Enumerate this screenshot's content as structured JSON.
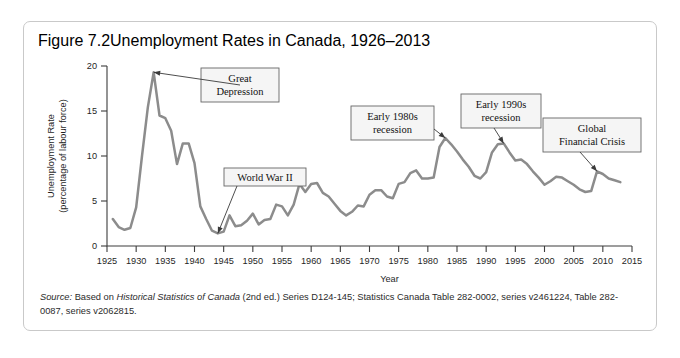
{
  "figure": {
    "number": "Figure 7.2",
    "title": "Unemployment Rates in Canada, 1926–2013"
  },
  "source": {
    "label": "Source:",
    "text_before": " Based on ",
    "italic_work": "Historical Statistics of Canada",
    "text_after": " (2nd ed.) Series D124-145; Statistics Canada Table 282-0002, series v2461224, Table 282-0087, series v2062815."
  },
  "chart_data": {
    "type": "line",
    "title": "Unemployment Rates in Canada, 1926–2013",
    "xlabel": "Year",
    "ylabel": "Unemployment Rate (percentage of labour force)",
    "ylabel_line1": "Unemployment Rate",
    "ylabel_line2": "(percentage of labour force)",
    "xlim": [
      1925,
      2015
    ],
    "ylim": [
      0,
      20
    ],
    "xticks": [
      1925,
      1930,
      1935,
      1940,
      1945,
      1950,
      1955,
      1960,
      1965,
      1970,
      1975,
      1980,
      1985,
      1990,
      1995,
      2000,
      2005,
      2010,
      2015
    ],
    "yticks": [
      0,
      5,
      10,
      15,
      20
    ],
    "grid": false,
    "legend": false,
    "line_color": "#8c8c8c",
    "series": [
      {
        "name": "Unemployment rate",
        "x": [
          1926,
          1927,
          1928,
          1929,
          1930,
          1931,
          1932,
          1933,
          1934,
          1935,
          1936,
          1937,
          1938,
          1939,
          1940,
          1941,
          1942,
          1943,
          1944,
          1945,
          1946,
          1947,
          1948,
          1949,
          1950,
          1951,
          1952,
          1953,
          1954,
          1955,
          1956,
          1957,
          1958,
          1959,
          1960,
          1961,
          1962,
          1963,
          1964,
          1965,
          1966,
          1967,
          1968,
          1969,
          1970,
          1971,
          1972,
          1973,
          1974,
          1975,
          1976,
          1977,
          1978,
          1979,
          1980,
          1981,
          1982,
          1983,
          1984,
          1985,
          1986,
          1987,
          1988,
          1989,
          1990,
          1991,
          1992,
          1993,
          1994,
          1995,
          1996,
          1997,
          1998,
          1999,
          2000,
          2001,
          2002,
          2003,
          2004,
          2005,
          2006,
          2007,
          2008,
          2009,
          2010,
          2011,
          2012,
          2013
        ],
        "values": [
          3.0,
          2.1,
          1.8,
          2.0,
          4.3,
          10.0,
          15.4,
          19.3,
          14.5,
          14.2,
          12.8,
          9.1,
          11.4,
          11.4,
          9.2,
          4.4,
          3.0,
          1.7,
          1.4,
          1.6,
          3.4,
          2.2,
          2.3,
          2.8,
          3.6,
          2.4,
          2.9,
          3.0,
          4.6,
          4.4,
          3.4,
          4.6,
          6.9,
          6.0,
          6.9,
          7.0,
          5.9,
          5.5,
          4.7,
          3.9,
          3.4,
          3.8,
          4.5,
          4.4,
          5.7,
          6.2,
          6.2,
          5.5,
          5.3,
          6.9,
          7.1,
          8.1,
          8.4,
          7.5,
          7.5,
          7.6,
          11.0,
          12.0,
          11.3,
          10.5,
          9.6,
          8.8,
          7.8,
          7.5,
          8.2,
          10.4,
          11.3,
          11.4,
          10.4,
          9.5,
          9.6,
          9.1,
          8.3,
          7.6,
          6.8,
          7.2,
          7.7,
          7.6,
          7.2,
          6.8,
          6.3,
          6.0,
          6.1,
          8.3,
          8.0,
          7.5,
          7.3,
          7.1
        ]
      }
    ],
    "annotations": [
      {
        "id": "great-depression",
        "label_line1": "Great",
        "label_line2": "Depression",
        "points_to_year": 1933,
        "points_to_value": 19.3
      },
      {
        "id": "world-war-ii",
        "label_line1": "World War II",
        "label_line2": "",
        "points_to_year": 1944,
        "points_to_value": 1.4
      },
      {
        "id": "early-1980s-recession",
        "label_line1": "Early 1980s",
        "label_line2": "recession",
        "points_to_year": 1983,
        "points_to_value": 12.0
      },
      {
        "id": "early-1990s-recession",
        "label_line1": "Early 1990s",
        "label_line2": "recession",
        "points_to_year": 1993,
        "points_to_value": 11.4
      },
      {
        "id": "global-financial-crisis",
        "label_line1": "Global",
        "label_line2": "Financial Crisis",
        "points_to_year": 2009,
        "points_to_value": 8.3
      }
    ]
  }
}
